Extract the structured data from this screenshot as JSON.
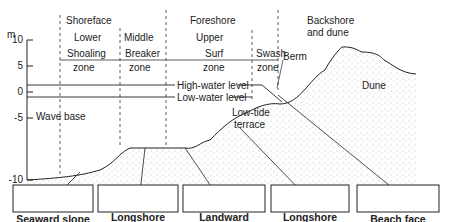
{
  "axis": {
    "unit": "m",
    "ticks": [
      {
        "label": "10",
        "value": 10
      },
      {
        "label": "5",
        "value": 5
      },
      {
        "label": "0",
        "value": 0
      },
      {
        "label": "-5",
        "value": -5
      },
      {
        "label": "-10",
        "value": -10
      }
    ]
  },
  "zones": {
    "shoreface": "Shoreface",
    "foreshore": "Foreshore",
    "backshore_line1": "Backshore",
    "backshore_line2": "and dune",
    "lower": "Lower",
    "middle": "Middle",
    "upper": "Upper",
    "shoaling_1": "Shoaling",
    "shoaling_2": "zone",
    "breaker_1": "Breaker",
    "breaker_2": "zone",
    "surf_1": "Surf",
    "surf_2": "zone",
    "swash_1": "Swash",
    "swash_2": "zone"
  },
  "profile_labels": {
    "high_water": "High-water level",
    "low_water": "Low-water level",
    "wave_base": "Wave base",
    "berm": "Berm",
    "dune": "Dune",
    "low_tide_1": "Low-tide",
    "low_tide_2": "terrace"
  },
  "insets": [
    {
      "line1": "Seaward slope",
      "line2": ""
    },
    {
      "line1": "Longshore",
      "line2": "bar crest"
    },
    {
      "line1": "Landward",
      "line2": "slope"
    },
    {
      "line1": "Longshore",
      "line2": "trough"
    },
    {
      "line1": "Beach face",
      "line2": ""
    }
  ],
  "colors": {
    "ink": "#222222",
    "sand_dot": "#777777",
    "background": "#ffffff"
  }
}
